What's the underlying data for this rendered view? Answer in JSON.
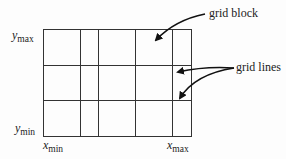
{
  "diagram": {
    "type": "grid-blocks",
    "labels": {
      "grid_block": "grid block",
      "grid_lines": "grid lines"
    },
    "axes": {
      "y_max": {
        "var": "y",
        "sub": "max"
      },
      "y_min": {
        "var": "y",
        "sub": "min"
      },
      "x_min": {
        "var": "x",
        "sub": "min"
      },
      "x_max": {
        "var": "x",
        "sub": "max"
      }
    },
    "grid": {
      "columns": 5,
      "rows": 3,
      "vertical_lines_px": [
        43,
        80,
        98,
        135,
        172,
        191
      ],
      "horizontal_lines_px": [
        29,
        65,
        100,
        136
      ],
      "line_color": "#333333"
    }
  }
}
